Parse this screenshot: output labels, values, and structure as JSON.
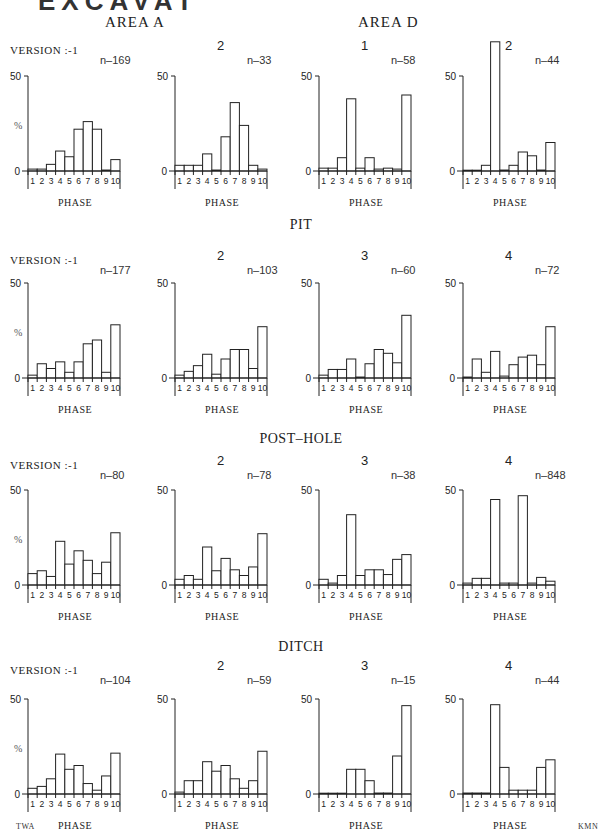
{
  "page": {
    "title_cut": "EXCAVAT",
    "areas": [
      "AREA  A",
      "AREA  D"
    ],
    "sections": [
      "PIT",
      "POST–HOLE",
      "DITCH"
    ],
    "credits": {
      "left": "TWA",
      "right": "KMN"
    },
    "axis": {
      "y_top": "50",
      "y_zero": "0",
      "y_unit": "%",
      "x_label": "PHASE",
      "x_ticks": [
        "1",
        "2",
        "3",
        "4",
        "5",
        "6",
        "7",
        "8",
        "9",
        "10"
      ]
    }
  },
  "chart_data": [
    {
      "type": "bar",
      "group": "AREA A / AREA D",
      "version": "VERSION :-1",
      "n": "n–169",
      "ylim": [
        0,
        50
      ],
      "xlabel": "PHASE",
      "ylabel": "%",
      "categories": [
        1,
        2,
        3,
        4,
        5,
        6,
        7,
        8,
        9,
        10
      ],
      "values": [
        1,
        1,
        3.5,
        10.5,
        7.5,
        22,
        26,
        22,
        0.5,
        6
      ]
    },
    {
      "type": "bar",
      "group": "AREA A / AREA D",
      "version": "2",
      "n": "n–33",
      "ylim": [
        0,
        50
      ],
      "xlabel": "PHASE",
      "categories": [
        1,
        2,
        3,
        4,
        5,
        6,
        7,
        8,
        9,
        10
      ],
      "values": [
        3,
        3,
        3,
        9,
        0.5,
        18,
        36,
        24,
        3,
        1
      ]
    },
    {
      "type": "bar",
      "group": "AREA A / AREA D",
      "version": "1",
      "n": "n–58",
      "ylim": [
        0,
        50
      ],
      "xlabel": "PHASE",
      "categories": [
        1,
        2,
        3,
        4,
        5,
        6,
        7,
        8,
        9,
        10
      ],
      "values": [
        1.5,
        1.5,
        7,
        38,
        1.5,
        7,
        1,
        1.5,
        1,
        40
      ]
    },
    {
      "type": "bar",
      "group": "AREA A / AREA D",
      "version": "2",
      "n": "n–44",
      "ylim": [
        0,
        50
      ],
      "xlabel": "PHASE",
      "categories": [
        1,
        2,
        3,
        4,
        5,
        6,
        7,
        8,
        9,
        10
      ],
      "values": [
        0.3,
        0.3,
        3,
        68,
        0.5,
        3,
        10,
        8,
        0.5,
        15
      ]
    },
    {
      "type": "bar",
      "group": "PIT",
      "version": "VERSION :-1",
      "n": "n–177",
      "ylim": [
        0,
        50
      ],
      "xlabel": "PHASE",
      "ylabel": "%",
      "categories": [
        1,
        2,
        3,
        4,
        5,
        6,
        7,
        8,
        9,
        10
      ],
      "values": [
        1.5,
        7.5,
        5,
        8.5,
        3,
        8.5,
        18,
        20,
        3,
        28
      ]
    },
    {
      "type": "bar",
      "group": "PIT",
      "version": "2",
      "n": "n–103",
      "ylim": [
        0,
        50
      ],
      "xlabel": "PHASE",
      "categories": [
        1,
        2,
        3,
        4,
        5,
        6,
        7,
        8,
        9,
        10
      ],
      "values": [
        1.5,
        3.5,
        6.5,
        12.5,
        2,
        10,
        15,
        15,
        5,
        27
      ]
    },
    {
      "type": "bar",
      "group": "PIT",
      "version": "3",
      "n": "n–60",
      "ylim": [
        0,
        50
      ],
      "xlabel": "PHASE",
      "categories": [
        1,
        2,
        3,
        4,
        5,
        6,
        7,
        8,
        9,
        10
      ],
      "values": [
        1.5,
        4.5,
        4.5,
        10,
        0.5,
        7.5,
        15,
        13,
        8,
        33
      ]
    },
    {
      "type": "bar",
      "group": "PIT",
      "version": "4",
      "n": "n–72",
      "ylim": [
        0,
        50
      ],
      "xlabel": "PHASE",
      "categories": [
        1,
        2,
        3,
        4,
        5,
        6,
        7,
        8,
        9,
        10
      ],
      "values": [
        0.5,
        10,
        3,
        14,
        1,
        7,
        11,
        12,
        7,
        27
      ]
    },
    {
      "type": "bar",
      "group": "POST–HOLE",
      "version": "VERSION :-1",
      "n": "n–80",
      "ylim": [
        0,
        50
      ],
      "xlabel": "PHASE",
      "ylabel": "%",
      "categories": [
        1,
        2,
        3,
        4,
        5,
        6,
        7,
        8,
        9,
        10
      ],
      "values": [
        6,
        7.5,
        4.5,
        23,
        11,
        18,
        13,
        6,
        12,
        27.5
      ]
    },
    {
      "type": "bar",
      "group": "POST–HOLE",
      "version": "2",
      "n": "n–78",
      "ylim": [
        0,
        50
      ],
      "xlabel": "PHASE",
      "categories": [
        1,
        2,
        3,
        4,
        5,
        6,
        7,
        8,
        9,
        10
      ],
      "values": [
        3,
        5,
        3,
        20,
        7.5,
        14,
        8,
        5,
        9.5,
        27
      ]
    },
    {
      "type": "bar",
      "group": "POST–HOLE",
      "version": "3",
      "n": "n–38",
      "ylim": [
        0,
        50
      ],
      "xlabel": "PHASE",
      "categories": [
        1,
        2,
        3,
        4,
        5,
        6,
        7,
        8,
        9,
        10
      ],
      "values": [
        3,
        1,
        5,
        37,
        5,
        8,
        8,
        5.5,
        13.5,
        16
      ]
    },
    {
      "type": "bar",
      "group": "POST–HOLE",
      "version": "4",
      "n": "n–848",
      "ylim": [
        0,
        50
      ],
      "xlabel": "PHASE",
      "categories": [
        1,
        2,
        3,
        4,
        5,
        6,
        7,
        8,
        9,
        10
      ],
      "values": [
        1,
        3.5,
        3.5,
        45,
        1,
        1,
        47,
        1,
        4,
        2
      ]
    },
    {
      "type": "bar",
      "group": "DITCH",
      "version": "VERSION :-1",
      "n": "n–104",
      "ylim": [
        0,
        50
      ],
      "xlabel": "PHASE",
      "ylabel": "%",
      "categories": [
        1,
        2,
        3,
        4,
        5,
        6,
        7,
        8,
        9,
        10
      ],
      "values": [
        3,
        4,
        8,
        21,
        13,
        15,
        5.5,
        2,
        9.5,
        21.5
      ]
    },
    {
      "type": "bar",
      "group": "DITCH",
      "version": "2",
      "n": "n–59",
      "ylim": [
        0,
        50
      ],
      "xlabel": "PHASE",
      "categories": [
        1,
        2,
        3,
        4,
        5,
        6,
        7,
        8,
        9,
        10
      ],
      "values": [
        1,
        7,
        7,
        17,
        12,
        15,
        8,
        3,
        7,
        22.5
      ]
    },
    {
      "type": "bar",
      "group": "DITCH",
      "version": "3",
      "n": "n–15",
      "ylim": [
        0,
        50
      ],
      "xlabel": "PHASE",
      "categories": [
        1,
        2,
        3,
        4,
        5,
        6,
        7,
        8,
        9,
        10
      ],
      "values": [
        0.3,
        0.3,
        0.3,
        13,
        13,
        7,
        0.5,
        0.5,
        20,
        46.5
      ]
    },
    {
      "type": "bar",
      "group": "DITCH",
      "version": "4",
      "n": "n–44",
      "ylim": [
        0,
        50
      ],
      "xlabel": "PHASE",
      "categories": [
        1,
        2,
        3,
        4,
        5,
        6,
        7,
        8,
        9,
        10
      ],
      "values": [
        0.5,
        0.5,
        0.5,
        47,
        14,
        2,
        2,
        2,
        14,
        18
      ]
    }
  ]
}
